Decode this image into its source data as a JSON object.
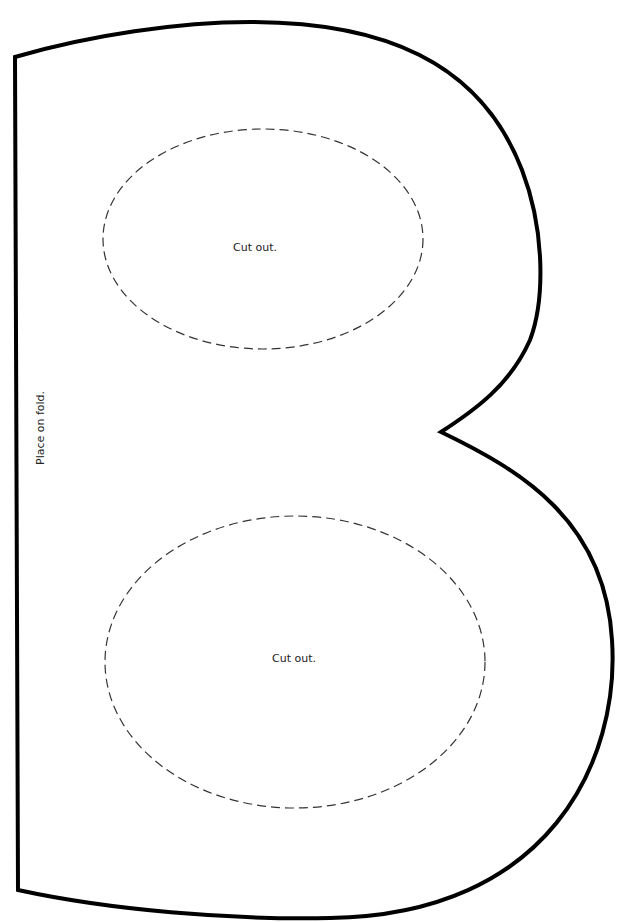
{
  "template": {
    "letter": "B",
    "outline_color": "#000000",
    "cut_line_color": "#333333",
    "cutouts": [
      {
        "label": "Cut out."
      },
      {
        "label": "Cut out."
      }
    ],
    "fold_label": "Place on fold."
  }
}
